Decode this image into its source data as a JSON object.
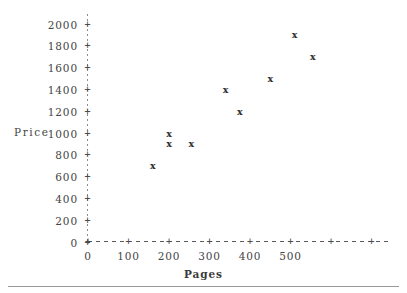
{
  "chart_data": {
    "type": "scatter",
    "title": "",
    "xlabel": "Pages",
    "ylabel": "Price",
    "xlim": [
      0,
      560
    ],
    "ylim": [
      0,
      2100
    ],
    "grid": false,
    "legend": null,
    "marker": "x",
    "x_ticks": [
      0,
      100,
      200,
      300,
      400,
      500
    ],
    "x_tick_labels": [
      "0",
      "100",
      "200",
      "300",
      "400",
      "500"
    ],
    "y_ticks": [
      0,
      200,
      400,
      600,
      800,
      1000,
      1200,
      1400,
      1600,
      1800,
      2000
    ],
    "y_tick_labels": [
      "0",
      "200",
      "400",
      "600",
      "800",
      "1000",
      "1200",
      "1400",
      "1600",
      "1800",
      "2000"
    ],
    "x": [
      160,
      200,
      200,
      255,
      340,
      375,
      450,
      510,
      555
    ],
    "y": [
      700,
      1000,
      900,
      900,
      1400,
      1200,
      1500,
      1900,
      1700
    ],
    "points": [
      {
        "pages": 160,
        "price": 700,
        "marker": "x"
      },
      {
        "pages": 200,
        "price": 1000,
        "marker": "x"
      },
      {
        "pages": 200,
        "price": 900,
        "marker": "x"
      },
      {
        "pages": 255,
        "price": 900,
        "marker": "x"
      },
      {
        "pages": 340,
        "price": 1400,
        "marker": "x"
      },
      {
        "pages": 375,
        "price": 1200,
        "marker": "x"
      },
      {
        "pages": 450,
        "price": 1500,
        "marker": "x"
      },
      {
        "pages": 510,
        "price": 1900,
        "marker": "x"
      },
      {
        "pages": 555,
        "price": 1700,
        "marker": "x"
      }
    ],
    "tick_glyph": "+",
    "axis_color": "#4a4a4a",
    "marker_color": "#2f2f2f"
  },
  "axes": {
    "y_title": "Price",
    "x_title": "Pages"
  }
}
